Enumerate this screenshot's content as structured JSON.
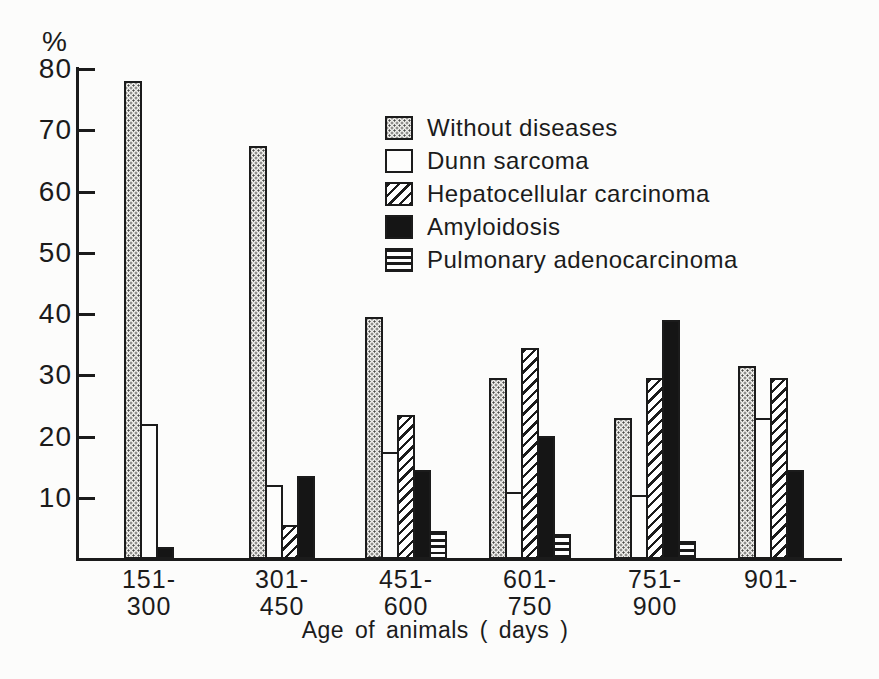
{
  "figure_title": "Diseases by age of animals bar chart",
  "chart_data": {
    "type": "bar",
    "title": "",
    "ylabel": "%",
    "xlabel": "Age of animals ( days )",
    "ylim": [
      0,
      80
    ],
    "yticks": [
      10,
      20,
      30,
      40,
      50,
      60,
      70,
      80
    ],
    "grid": false,
    "legend_position": "upper-center-inside",
    "categories": [
      "151-300",
      "301-450",
      "451-600",
      "601-750",
      "751-900",
      "901-"
    ],
    "category_labels": [
      [
        "151-",
        "300"
      ],
      [
        "301-",
        "450"
      ],
      [
        "451-",
        "600"
      ],
      [
        "601-",
        "750"
      ],
      [
        "751-",
        "900"
      ],
      [
        "901-"
      ]
    ],
    "series": [
      {
        "name": "Without diseases",
        "pattern": "stipple",
        "values": [
          78,
          67.5,
          39.5,
          29.5,
          23,
          31.5
        ]
      },
      {
        "name": "Dunn sarcoma",
        "pattern": "plain",
        "values": [
          22,
          12,
          17.5,
          11,
          10.5,
          23
        ]
      },
      {
        "name": "Hepatocellular carcinoma",
        "pattern": "diagonal-hatch",
        "values": [
          null,
          5.5,
          23.5,
          34.5,
          29.5,
          29.5
        ]
      },
      {
        "name": "Amyloidosis",
        "pattern": "solid-black",
        "values": [
          2,
          13.5,
          14.5,
          20,
          39,
          14.5
        ]
      },
      {
        "name": "Pulmonary adenocarcinoma",
        "pattern": "horizontal-lines",
        "values": [
          null,
          null,
          4.5,
          4,
          3,
          null
        ]
      }
    ],
    "colors": {
      "ink": "#1b1b1b",
      "paper": "#fcfcfb",
      "stipple_fill": "#f0efec"
    }
  }
}
